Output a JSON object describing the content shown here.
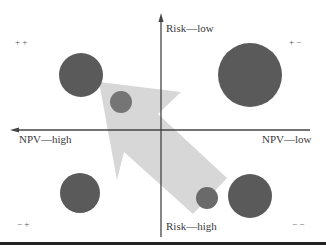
{
  "axes": {
    "y_top_label": "Risk—low",
    "y_bottom_label": "Risk—high",
    "x_left_label": "NPV—high",
    "x_right_label": "NPV—low"
  },
  "quadrants": {
    "top_left": "+ +",
    "top_right": "+ −",
    "bottom_left": "− +",
    "bottom_right": "− −"
  },
  "colors": {
    "circle_fill": "#5a5a5a",
    "small_circle_fill": "#6e6e6e",
    "arrow_fill": "#d4d4d4",
    "axis_color": "#444444",
    "border_color": "#222222"
  },
  "bubbles": [
    {
      "id": "top-left-large",
      "cx": 81,
      "cy": 75,
      "r": 22
    },
    {
      "id": "top-right-large",
      "cx": 250,
      "cy": 75,
      "r": 32
    },
    {
      "id": "top-left-small",
      "cx": 121,
      "cy": 102,
      "r": 11
    },
    {
      "id": "bottom-left",
      "cx": 80,
      "cy": 193,
      "r": 20
    },
    {
      "id": "bottom-right-large",
      "cx": 250,
      "cy": 196,
      "r": 22
    },
    {
      "id": "bottom-right-small",
      "cx": 207,
      "cy": 198,
      "r": 11
    }
  ],
  "arrow": {
    "direction": "toward upper-left (higher NPV, lower risk)"
  }
}
